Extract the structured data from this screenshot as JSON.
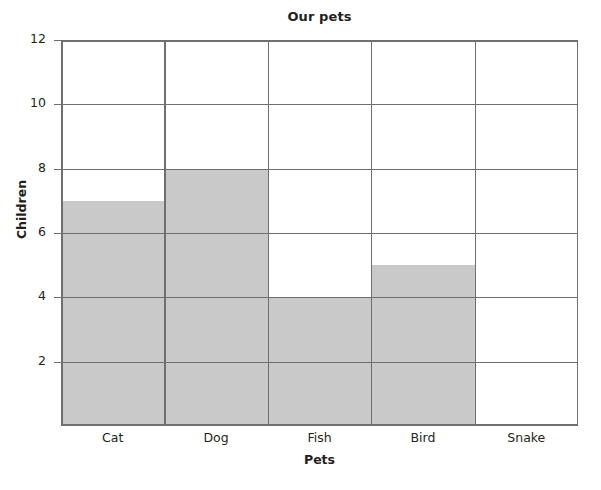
{
  "chart_data": {
    "type": "bar",
    "title": "Our pets",
    "xlabel": "Pets",
    "ylabel": "Children",
    "categories": [
      "Cat",
      "Dog",
      "Fish",
      "Bird",
      "Snake"
    ],
    "values": [
      7,
      8,
      4,
      5,
      0
    ],
    "ylim": [
      0,
      12
    ],
    "yticks": [
      2,
      4,
      6,
      8,
      10,
      12
    ],
    "ytick_labels": [
      "2",
      "4",
      "6",
      "8",
      "10",
      "12"
    ],
    "grid": true,
    "grid_axis": "both",
    "legend": false,
    "bar_color": "#c9c9c9",
    "grid_color": "#6f6f6f",
    "background_color": "#ffffff",
    "text_color": "#231f20"
  },
  "geometry": {
    "plot_left": 61,
    "plot_top": 40,
    "plot_width": 517,
    "plot_height": 386,
    "column_width": 103.4,
    "unit_height": 32.1667
  }
}
